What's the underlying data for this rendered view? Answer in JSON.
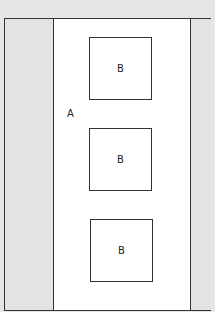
{
  "diagram": {
    "container_label": "A",
    "boxes": [
      {
        "label": "B"
      },
      {
        "label": "B"
      },
      {
        "label": "B"
      }
    ],
    "colors": {
      "background": "#e6e6e6",
      "side_panels": "#e3e3e3",
      "center": "#ffffff",
      "stroke": "#333333"
    }
  }
}
